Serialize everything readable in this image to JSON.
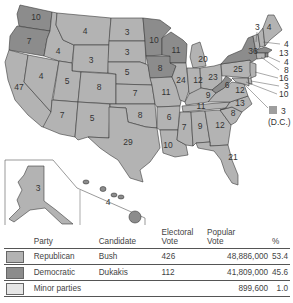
{
  "map": {
    "title": "1988 Presidential Election Electoral Votes by State",
    "colors": {
      "republican": "#b3b3b3",
      "democratic": "#8c8c8c",
      "minor": "#e6e6e6",
      "dc": "#9e9e9e"
    },
    "states": [
      {
        "name": "Washington",
        "votes": "10",
        "party": "democratic"
      },
      {
        "name": "Oregon",
        "votes": "7",
        "party": "democratic"
      },
      {
        "name": "California",
        "votes": "47",
        "party": "republican"
      },
      {
        "name": "Idaho",
        "votes": "4",
        "party": "republican"
      },
      {
        "name": "Nevada",
        "votes": "4",
        "party": "republican"
      },
      {
        "name": "Montana",
        "votes": "4",
        "party": "republican"
      },
      {
        "name": "Wyoming",
        "votes": "3",
        "party": "republican"
      },
      {
        "name": "Utah",
        "votes": "5",
        "party": "republican"
      },
      {
        "name": "Arizona",
        "votes": "7",
        "party": "republican"
      },
      {
        "name": "Colorado",
        "votes": "8",
        "party": "republican"
      },
      {
        "name": "New Mexico",
        "votes": "5",
        "party": "republican"
      },
      {
        "name": "North Dakota",
        "votes": "3",
        "party": "republican"
      },
      {
        "name": "South Dakota",
        "votes": "3",
        "party": "republican"
      },
      {
        "name": "Nebraska",
        "votes": "5",
        "party": "republican"
      },
      {
        "name": "Kansas",
        "votes": "7",
        "party": "republican"
      },
      {
        "name": "Oklahoma",
        "votes": "8",
        "party": "republican"
      },
      {
        "name": "Texas",
        "votes": "29",
        "party": "republican"
      },
      {
        "name": "Minnesota",
        "votes": "10",
        "party": "democratic"
      },
      {
        "name": "Iowa",
        "votes": "8",
        "party": "democratic"
      },
      {
        "name": "Missouri",
        "votes": "11",
        "party": "republican"
      },
      {
        "name": "Arkansas",
        "votes": "6",
        "party": "republican"
      },
      {
        "name": "Louisiana",
        "votes": "10",
        "party": "republican"
      },
      {
        "name": "Wisconsin",
        "votes": "11",
        "party": "democratic"
      },
      {
        "name": "Illinois",
        "votes": "24",
        "party": "republican"
      },
      {
        "name": "Michigan",
        "votes": "20",
        "party": "republican"
      },
      {
        "name": "Indiana",
        "votes": "12",
        "party": "republican"
      },
      {
        "name": "Ohio",
        "votes": "23",
        "party": "republican"
      },
      {
        "name": "Kentucky",
        "votes": "9",
        "party": "republican"
      },
      {
        "name": "Tennessee",
        "votes": "11",
        "party": "republican"
      },
      {
        "name": "Mississippi",
        "votes": "7",
        "party": "republican"
      },
      {
        "name": "Alabama",
        "votes": "9",
        "party": "republican"
      },
      {
        "name": "Georgia",
        "votes": "12",
        "party": "republican"
      },
      {
        "name": "Florida",
        "votes": "21",
        "party": "republican"
      },
      {
        "name": "South Carolina",
        "votes": "8",
        "party": "republican"
      },
      {
        "name": "North Carolina",
        "votes": "13",
        "party": "republican"
      },
      {
        "name": "Virginia",
        "votes": "12",
        "party": "republican"
      },
      {
        "name": "West Virginia",
        "votes": "6",
        "party": "democratic"
      },
      {
        "name": "Pennsylvania",
        "votes": "25",
        "party": "republican"
      },
      {
        "name": "New York",
        "votes": "36",
        "party": "democratic"
      },
      {
        "name": "Vermont",
        "votes": "3",
        "party": "republican"
      },
      {
        "name": "New Hampshire",
        "votes": "4",
        "party": "republican"
      },
      {
        "name": "Maine",
        "votes": "4",
        "party": "republican"
      },
      {
        "name": "Massachusetts",
        "votes": "13",
        "party": "democratic"
      },
      {
        "name": "Rhode Island",
        "votes": "4",
        "party": "democratic"
      },
      {
        "name": "Connecticut",
        "votes": "8",
        "party": "republican"
      },
      {
        "name": "New Jersey",
        "votes": "16",
        "party": "republican"
      },
      {
        "name": "Delaware",
        "votes": "3",
        "party": "republican"
      },
      {
        "name": "Maryland",
        "votes": "10",
        "party": "republican"
      },
      {
        "name": "Alaska",
        "votes": "3",
        "party": "republican"
      },
      {
        "name": "Hawaii",
        "votes": "4",
        "party": "democratic"
      }
    ],
    "callouts": {
      "nh": "4",
      "ma": "13",
      "ri": "4",
      "ct": "8",
      "nj": "16",
      "de": "3",
      "md": "10",
      "vt": "3"
    },
    "dc": {
      "votes": "3",
      "label": "(D.C.)"
    }
  },
  "table": {
    "headers": {
      "party": "Party",
      "candidate": "Candidate",
      "electoral": "Electoral Vote",
      "electoral_1": "Electoral",
      "electoral_2": "Vote",
      "popular_1": "Popular",
      "popular_2": "Vote",
      "percent": "%"
    },
    "rows": [
      {
        "party": "Republican",
        "candidate": "Bush",
        "electoral": "426",
        "popular": "48,886,000",
        "percent": "53.4",
        "color": "#b3b3b3"
      },
      {
        "party": "Democratic",
        "candidate": "Dukakis",
        "electoral": "112",
        "popular": "41,809,000",
        "percent": "45.6",
        "color": "#8c8c8c"
      },
      {
        "party": "Minor parties",
        "candidate": "",
        "electoral": "",
        "popular": "899,600",
        "percent": "1.0",
        "color": "#e6e6e6"
      }
    ]
  }
}
